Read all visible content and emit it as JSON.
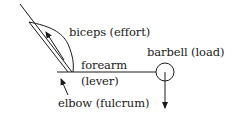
{
  "diagram": {
    "type": "lever diagram",
    "labels": {
      "biceps": "biceps (effort)",
      "forearm": "forearm",
      "lever": "(lever)",
      "elbow": "elbow (fulcrum)",
      "barbell": "barbell (load)"
    },
    "colors": {
      "stroke": "#1a1a1a",
      "background": "#ffffff"
    }
  }
}
